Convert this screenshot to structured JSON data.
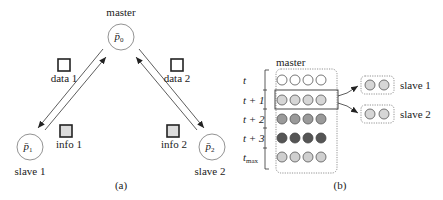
{
  "panel_a": {
    "caption": "(a)",
    "master": {
      "label": "master",
      "symbol": "p̄",
      "subscript": "0"
    },
    "slaves": [
      {
        "label": "slave 1",
        "symbol": "p̄",
        "subscript": "1"
      },
      {
        "label": "slave 2",
        "symbol": "p̄",
        "subscript": "2"
      }
    ],
    "messages": [
      {
        "label": "data 1",
        "direction": "master-to-slave",
        "box_color": "#ffffff"
      },
      {
        "label": "info 1",
        "direction": "slave-to-master",
        "box_color": "#dcdcdc"
      },
      {
        "label": "data 2",
        "direction": "master-to-slave",
        "box_color": "#ffffff"
      },
      {
        "label": "info 2",
        "direction": "slave-to-master",
        "box_color": "#dcdcdc"
      }
    ]
  },
  "panel_b": {
    "caption": "(b)",
    "master_label": "master",
    "time_rows": [
      {
        "label": "t",
        "sub": "",
        "fill": "#ffffff"
      },
      {
        "label": "t + 1",
        "sub": "",
        "fill": "#d6d6d6"
      },
      {
        "label": "t + 2",
        "sub": "",
        "fill": "#9a9a9a"
      },
      {
        "label": "t + 3",
        "sub": "",
        "fill": "#555555"
      },
      {
        "label": "t",
        "sub": "max",
        "fill": "#cfcfcf"
      }
    ],
    "circles_per_row": 4,
    "highlighted_row": 1,
    "slaves": [
      {
        "label": "slave 1",
        "circles": 2,
        "fill": "#d6d6d6"
      },
      {
        "label": "slave 2",
        "circles": 2,
        "fill": "#d6d6d6"
      }
    ]
  }
}
